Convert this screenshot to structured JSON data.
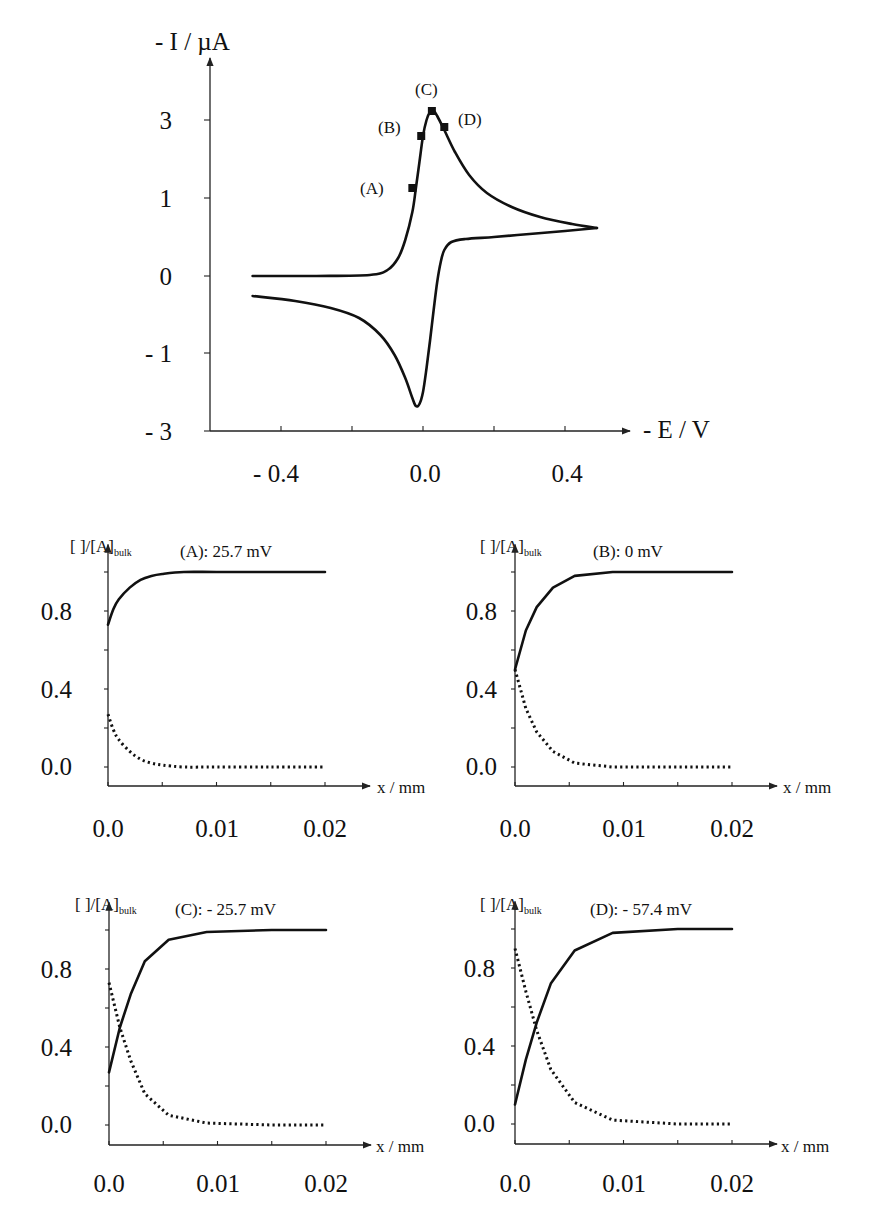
{
  "chart_data": [
    {
      "id": "cv",
      "type": "line",
      "title": "",
      "ylabel": "- I / µA",
      "xlabel": "- E / V",
      "x_ticks": [
        -0.4,
        -0.2,
        0.0,
        0.2,
        0.4
      ],
      "x_tick_labels": [
        "- 0.4",
        "",
        "0.0",
        "",
        "0.4"
      ],
      "y_ticks": [
        3,
        1,
        0,
        -1,
        -3
      ],
      "y_tick_labels": [
        "3",
        "1",
        "0",
        "- 1",
        "- 3"
      ],
      "grid": false,
      "series": [
        {
          "name": "forward sweep",
          "x": [
            -0.48,
            -0.3,
            -0.15,
            -0.1,
            -0.07,
            -0.05,
            -0.03,
            -0.02,
            -0.01,
            0.0,
            0.01,
            0.02,
            0.03,
            0.04,
            0.06,
            0.09,
            0.13,
            0.18,
            0.25,
            0.33,
            0.42,
            0.49
          ],
          "y_px": [
            276,
            276,
            275,
            270,
            258,
            240,
            212,
            188,
            162,
            136,
            120,
            112,
            111,
            116,
            130,
            152,
            175,
            193,
            207,
            217,
            224,
            228
          ]
        },
        {
          "name": "reverse sweep",
          "x": [
            0.49,
            0.4,
            0.3,
            0.2,
            0.12,
            0.08,
            0.06,
            0.05,
            0.04,
            0.03,
            0.02,
            0.01,
            0.0,
            -0.01,
            -0.02,
            -0.03,
            -0.05,
            -0.08,
            -0.12,
            -0.18,
            -0.26,
            -0.36,
            -0.48
          ],
          "y_px": [
            228,
            231,
            234,
            237,
            239,
            242,
            250,
            262,
            282,
            310,
            340,
            368,
            392,
            404,
            406,
            398,
            378,
            355,
            335,
            318,
            308,
            301,
            296
          ]
        }
      ],
      "markers": [
        {
          "label": "(A)",
          "x": -0.03,
          "y_px": 188
        },
        {
          "label": "(B)",
          "x": -0.005,
          "y_px": 136
        },
        {
          "label": "(C)",
          "x": 0.025,
          "y_px": 111
        },
        {
          "label": "(D)",
          "x": 0.06,
          "y_px": 127
        }
      ]
    },
    {
      "id": "A",
      "type": "line",
      "title": "(A):  25.7 mV",
      "ylabel": "[   ]/[A]bulk",
      "xlabel": "x / mm",
      "x_ticks": [
        0.0,
        0.01,
        0.02
      ],
      "x_tick_labels": [
        "0.0",
        "0.01",
        "0.02"
      ],
      "y_ticks": [
        0.0,
        0.4,
        0.8
      ],
      "y_tick_labels": [
        "0.0",
        "0.4",
        "0.8"
      ],
      "xlim": [
        0,
        0.02
      ],
      "ylim": [
        -0.1,
        1.1
      ],
      "series": [
        {
          "name": "oxidized (solid)",
          "x": [
            0,
            0.0005,
            0.001,
            0.002,
            0.003,
            0.004,
            0.005,
            0.007,
            0.01,
            0.015,
            0.02
          ],
          "y": [
            0.73,
            0.81,
            0.86,
            0.92,
            0.96,
            0.98,
            0.99,
            1.0,
            1.0,
            1.0,
            1.0
          ]
        },
        {
          "name": "reduced (dotted)",
          "x": [
            0,
            0.0005,
            0.001,
            0.002,
            0.003,
            0.004,
            0.005,
            0.007,
            0.01,
            0.015,
            0.02
          ],
          "y": [
            0.27,
            0.19,
            0.14,
            0.08,
            0.04,
            0.02,
            0.01,
            0.0,
            0.0,
            0.0,
            0.0
          ]
        }
      ]
    },
    {
      "id": "B",
      "type": "line",
      "title": "(B): 0 mV",
      "ylabel": "[   ]/[A]bulk",
      "xlabel": "x / mm",
      "x_ticks": [
        0.0,
        0.01,
        0.02
      ],
      "x_tick_labels": [
        "0.0",
        "0.01",
        "0.02"
      ],
      "y_ticks": [
        0.0,
        0.4,
        0.8
      ],
      "y_tick_labels": [
        "0.0",
        "0.4",
        "0.8"
      ],
      "xlim": [
        0,
        0.02
      ],
      "ylim": [
        -0.1,
        1.1
      ],
      "series": [
        {
          "name": "oxidized (solid)",
          "x": [
            0,
            0.001,
            0.002,
            0.0035,
            0.0055,
            0.009,
            0.015,
            0.02
          ],
          "y": [
            0.5,
            0.7,
            0.82,
            0.92,
            0.98,
            1.0,
            1.0,
            1.0
          ]
        },
        {
          "name": "reduced (dotted)",
          "x": [
            0,
            0.001,
            0.002,
            0.0035,
            0.0055,
            0.009,
            0.015,
            0.02
          ],
          "y": [
            0.5,
            0.3,
            0.18,
            0.08,
            0.02,
            0.0,
            0.0,
            0.0
          ]
        }
      ]
    },
    {
      "id": "C",
      "type": "line",
      "title": "(C):  - 25.7 mV",
      "ylabel": "[   ]/[A]bulk",
      "xlabel": "x / mm",
      "x_ticks": [
        0.0,
        0.01,
        0.02
      ],
      "x_tick_labels": [
        "0.0",
        "0.01",
        "0.02"
      ],
      "y_ticks": [
        0.0,
        0.4,
        0.8
      ],
      "y_tick_labels": [
        "0.0",
        "0.4",
        "0.8"
      ],
      "xlim": [
        0,
        0.02
      ],
      "ylim": [
        -0.1,
        1.1
      ],
      "series": [
        {
          "name": "oxidized (solid)",
          "x": [
            0,
            0.001,
            0.002,
            0.0033,
            0.0055,
            0.009,
            0.015,
            0.02
          ],
          "y": [
            0.27,
            0.5,
            0.67,
            0.84,
            0.95,
            0.99,
            1.0,
            1.0
          ]
        },
        {
          "name": "reduced (dotted)",
          "x": [
            0,
            0.001,
            0.002,
            0.0033,
            0.0055,
            0.009,
            0.015,
            0.02
          ],
          "y": [
            0.73,
            0.5,
            0.33,
            0.16,
            0.05,
            0.01,
            0.0,
            0.0
          ]
        }
      ]
    },
    {
      "id": "D",
      "type": "line",
      "title": "(D):   - 57.4 mV",
      "ylabel": "[   ]/[A]bulk",
      "xlabel": "x / mm",
      "x_ticks": [
        0.0,
        0.01,
        0.02
      ],
      "x_tick_labels": [
        "0.0",
        "0.01",
        "0.02"
      ],
      "y_ticks": [
        0.0,
        0.4,
        0.8
      ],
      "y_tick_labels": [
        "0.0",
        "0.4",
        "0.8"
      ],
      "xlim": [
        0,
        0.02
      ],
      "ylim": [
        -0.1,
        1.1
      ],
      "series": [
        {
          "name": "oxidized (solid)",
          "x": [
            0,
            0.001,
            0.002,
            0.0033,
            0.0055,
            0.009,
            0.015,
            0.02
          ],
          "y": [
            0.1,
            0.33,
            0.52,
            0.72,
            0.89,
            0.98,
            1.0,
            1.0
          ]
        },
        {
          "name": "reduced (dotted)",
          "x": [
            0,
            0.001,
            0.002,
            0.0033,
            0.0055,
            0.009,
            0.015,
            0.02
          ],
          "y": [
            0.9,
            0.68,
            0.48,
            0.28,
            0.11,
            0.02,
            0.0,
            0.0
          ]
        }
      ]
    }
  ],
  "cv_layout": {
    "origin_x_px": 210,
    "x_axis_y_px": 431,
    "x_axis_end_px": 630,
    "y_axis_top_px": 58,
    "x_zero_px": 423,
    "px_per_volt": 355,
    "y_tick_px": [
      120,
      198,
      276,
      353,
      431
    ]
  },
  "panel_layout": [
    {
      "id": "A",
      "ox": 108,
      "y0": 767,
      "xaxis_y": 786,
      "px_per_x": 10850,
      "px_per_y": 195
    },
    {
      "id": "B",
      "ox": 515,
      "y0": 767,
      "xaxis_y": 786,
      "px_per_x": 10850,
      "px_per_y": 195
    },
    {
      "id": "C",
      "ox": 109,
      "y0": 1125,
      "xaxis_y": 1145,
      "px_per_x": 10850,
      "px_per_y": 195
    },
    {
      "id": "D",
      "ox": 515,
      "y0": 1124,
      "xaxis_y": 1144,
      "px_per_x": 10850,
      "px_per_y": 195
    }
  ]
}
